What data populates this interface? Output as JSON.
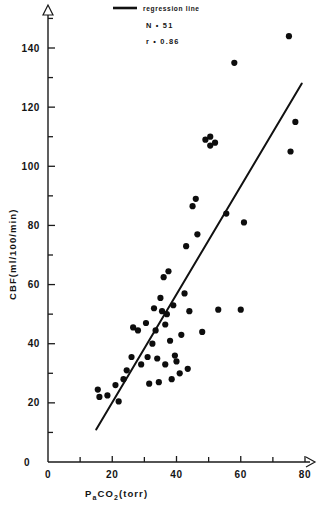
{
  "chart_data": {
    "type": "scatter",
    "title": "",
    "xlabel": "Pa CO2  (torr)",
    "xlabel_main": "P",
    "xlabel_sub": "a",
    "xlabel_rest": "CO",
    "xlabel_sub2": "2",
    "xlabel_units": "(torr)",
    "ylabel": "CBF  (ml/100/min)",
    "ylabel_main": "CBF",
    "ylabel_units": "(ml/100/min)",
    "xlim": [
      0,
      85
    ],
    "ylim": [
      0,
      150
    ],
    "xticks": [
      0,
      20,
      40,
      60,
      80
    ],
    "xticks_labels": [
      "0",
      "20",
      "40",
      "60",
      "80"
    ],
    "xminor": [
      10,
      30,
      50,
      70
    ],
    "yticks": [
      0,
      20,
      40,
      60,
      80,
      100,
      120,
      140
    ],
    "yticks_labels": [
      "0",
      "20",
      "40",
      "60",
      "80",
      "100",
      "120",
      "140"
    ],
    "yminor": [
      10,
      30,
      50,
      70,
      90,
      110,
      130,
      150
    ],
    "grid": false,
    "origin_label": "0",
    "n_points": 51,
    "points": [
      {
        "x": 15.5,
        "y": 24.5
      },
      {
        "x": 16.0,
        "y": 22.0
      },
      {
        "x": 18.5,
        "y": 22.5
      },
      {
        "x": 21.0,
        "y": 26.0
      },
      {
        "x": 22.0,
        "y": 20.5
      },
      {
        "x": 23.5,
        "y": 28.0
      },
      {
        "x": 24.5,
        "y": 31.0
      },
      {
        "x": 26.0,
        "y": 35.5
      },
      {
        "x": 26.5,
        "y": 45.5
      },
      {
        "x": 28.0,
        "y": 44.5
      },
      {
        "x": 29.0,
        "y": 33.0
      },
      {
        "x": 30.5,
        "y": 47.0
      },
      {
        "x": 31.0,
        "y": 35.5
      },
      {
        "x": 31.5,
        "y": 26.5
      },
      {
        "x": 32.5,
        "y": 40.0
      },
      {
        "x": 33.0,
        "y": 52.0
      },
      {
        "x": 33.5,
        "y": 44.5
      },
      {
        "x": 34.0,
        "y": 35.0
      },
      {
        "x": 34.5,
        "y": 27.0
      },
      {
        "x": 35.0,
        "y": 55.5
      },
      {
        "x": 35.5,
        "y": 51.0
      },
      {
        "x": 36.0,
        "y": 62.5
      },
      {
        "x": 36.5,
        "y": 46.5
      },
      {
        "x": 36.5,
        "y": 33.0
      },
      {
        "x": 37.0,
        "y": 50.0
      },
      {
        "x": 37.5,
        "y": 64.5
      },
      {
        "x": 38.0,
        "y": 41.0
      },
      {
        "x": 38.5,
        "y": 28.0
      },
      {
        "x": 39.0,
        "y": 53.0
      },
      {
        "x": 39.5,
        "y": 36.0
      },
      {
        "x": 40.0,
        "y": 34.0
      },
      {
        "x": 41.0,
        "y": 30.0
      },
      {
        "x": 41.5,
        "y": 43.0
      },
      {
        "x": 42.5,
        "y": 57.0
      },
      {
        "x": 43.0,
        "y": 73.0
      },
      {
        "x": 43.5,
        "y": 31.5
      },
      {
        "x": 44.0,
        "y": 51.0
      },
      {
        "x": 45.0,
        "y": 86.5
      },
      {
        "x": 46.0,
        "y": 89.0
      },
      {
        "x": 46.5,
        "y": 77.0
      },
      {
        "x": 48.0,
        "y": 44.0
      },
      {
        "x": 49.0,
        "y": 109.0
      },
      {
        "x": 50.5,
        "y": 110.0
      },
      {
        "x": 50.5,
        "y": 107.0
      },
      {
        "x": 52.0,
        "y": 108.0
      },
      {
        "x": 53.0,
        "y": 51.5
      },
      {
        "x": 55.5,
        "y": 84.0
      },
      {
        "x": 58.0,
        "y": 135.0
      },
      {
        "x": 60.0,
        "y": 51.5
      },
      {
        "x": 61.0,
        "y": 81.0
      },
      {
        "x": 75.0,
        "y": 144.0
      },
      {
        "x": 75.5,
        "y": 105.0
      },
      {
        "x": 77.0,
        "y": 115.0
      }
    ],
    "regression": {
      "label": "regression line",
      "x_start": 15.0,
      "y_start": 11.0,
      "x_end": 79.0,
      "y_end": 128.0
    },
    "annotations": {
      "n_label": "N • 51",
      "r_label": "r • 0.86"
    }
  }
}
